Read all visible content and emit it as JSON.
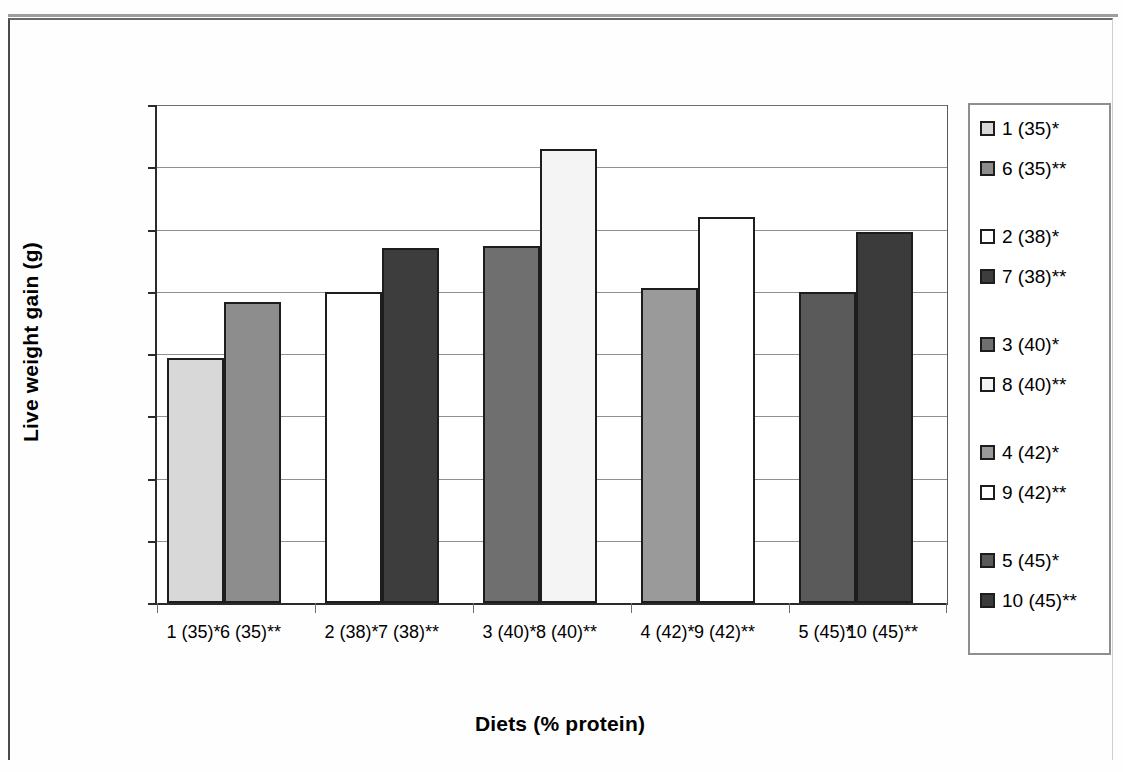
{
  "chart_data": {
    "type": "bar",
    "title": "",
    "xlabel": "Diets (% protein)",
    "ylabel": "Live weight gain (g)",
    "ylim": [
      0,
      24
    ],
    "yticks": [
      "0.00",
      "3.00",
      "6.00",
      "9.00",
      "12.00",
      "15.00",
      "18.00",
      "21.00",
      "24.00"
    ],
    "ytick_values": [
      0,
      3,
      6,
      9,
      12,
      15,
      18,
      21,
      24
    ],
    "grid": "horizontal",
    "legend_position": "right",
    "categories": [
      "1 (35)*",
      "6 (35)**",
      "2 (38)*",
      "7 (38)**",
      "3 (40)*",
      "8 (40)**",
      "4 (42)*",
      "9 (42)**",
      "5 (45)*",
      "10 (45)**"
    ],
    "values": [
      11.8,
      14.5,
      15.0,
      17.1,
      17.2,
      21.9,
      15.2,
      18.6,
      15.0,
      17.9
    ],
    "colors": [
      "#d8d8d8",
      "#8d8d8d",
      "#ffffff",
      "#3d3d3d",
      "#6f6f6f",
      "#f4f4f4",
      "#9a9a9a",
      "#ffffff",
      "#5a5a5a",
      "#3b3b3b"
    ],
    "groups": [
      {
        "label": "35",
        "bars": [
          "1 (35)*",
          "6 (35)**"
        ]
      },
      {
        "label": "38",
        "bars": [
          "2 (38)*",
          "7 (38)**"
        ]
      },
      {
        "label": "40",
        "bars": [
          "3 (40)*",
          "8 (40)**"
        ]
      },
      {
        "label": "42",
        "bars": [
          "4 (42)*",
          "9 (42)**"
        ]
      },
      {
        "label": "45",
        "bars": [
          "5 (45)*",
          "10 (45)**"
        ]
      }
    ]
  },
  "legend": {
    "items": [
      {
        "label": "1 (35)*",
        "color": "#d8d8d8"
      },
      {
        "label": "6 (35)**",
        "color": "#8d8d8d"
      },
      {
        "label": "2 (38)*",
        "color": "#ffffff"
      },
      {
        "label": "7 (38)**",
        "color": "#3d3d3d"
      },
      {
        "label": "3 (40)*",
        "color": "#6f6f6f"
      },
      {
        "label": "8 (40)**",
        "color": "#f4f4f4"
      },
      {
        "label": "4 (42)*",
        "color": "#9a9a9a"
      },
      {
        "label": "9 (42)**",
        "color": "#ffffff"
      },
      {
        "label": "5 (45)*",
        "color": "#5a5a5a"
      },
      {
        "label": "10 (45)**",
        "color": "#3b3b3b"
      }
    ]
  },
  "axis": {
    "y_title": "Live weight gain (g)",
    "x_title": "Diets (% protein)"
  }
}
